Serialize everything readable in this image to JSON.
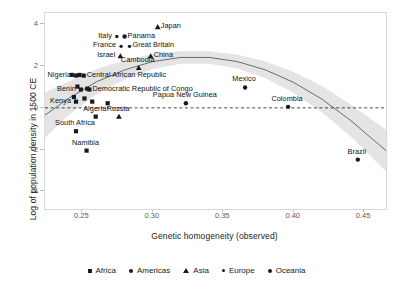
{
  "chart_data": {
    "type": "scatter",
    "title": "",
    "xlabel": "Genetic homogeneity (observed)",
    "ylabel": "Log of population density in 1500 CE",
    "xlim": [
      0.2235,
      0.4655
    ],
    "ylim": [
      -4.85,
      4.55
    ],
    "xticks": [
      "0.25",
      "0.30",
      "0.35",
      "0.40",
      "0.45"
    ],
    "xtick_values": [
      0.25,
      0.3,
      0.35,
      0.4,
      0.45
    ],
    "yticks": [
      "4",
      "2",
      "0",
      "-2",
      "-4"
    ],
    "ytick_values": [
      4,
      2,
      0,
      -2,
      -4
    ],
    "grid": false,
    "legend_position": "bottom",
    "reference_line": {
      "type": "horizontal",
      "y": 0,
      "style": "dashed"
    },
    "fit": {
      "type": "quadratic-loess",
      "band": "confidence interval",
      "band_color": "#d3d3d3",
      "line_color": "#6b6b6b",
      "x": [
        0.2235,
        0.24,
        0.26,
        0.28,
        0.3,
        0.32,
        0.34,
        0.36,
        0.38,
        0.4,
        0.42,
        0.44,
        0.4655
      ],
      "y": [
        -0.35,
        0.45,
        1.25,
        1.82,
        2.22,
        2.42,
        2.42,
        2.22,
        1.82,
        1.22,
        0.42,
        -0.58,
        -2.05
      ],
      "upper": [
        0.75,
        1.25,
        1.85,
        2.28,
        2.58,
        2.72,
        2.72,
        2.55,
        2.22,
        1.72,
        1.05,
        0.18,
        -1.05
      ],
      "lower": [
        -1.45,
        -0.35,
        0.65,
        1.36,
        1.86,
        2.12,
        2.12,
        1.89,
        1.42,
        0.72,
        -0.21,
        -1.34,
        -3.05
      ]
    },
    "legend": [
      {
        "label": "Africa",
        "marker": "square"
      },
      {
        "label": "Americas",
        "marker": "circle"
      },
      {
        "label": "Asia",
        "marker": "triangle"
      },
      {
        "label": "Europe",
        "marker": "dot"
      },
      {
        "label": "Oceania",
        "marker": "circle"
      }
    ],
    "points": [
      {
        "name": "Japan",
        "x": 0.3035,
        "y": 3.88,
        "marker": "triangle",
        "label_pos": "l"
      },
      {
        "name": "Italy",
        "x": 0.2745,
        "y": 3.42,
        "marker": "dot",
        "label_pos": "r"
      },
      {
        "name": "Panama",
        "x": 0.28,
        "y": 3.42,
        "marker": "circle",
        "label_pos": "l"
      },
      {
        "name": "France",
        "x": 0.2775,
        "y": 2.95,
        "marker": "dot",
        "label_pos": "r"
      },
      {
        "name": "Great Britain",
        "x": 0.2835,
        "y": 2.95,
        "marker": "dot",
        "label_pos": "l"
      },
      {
        "name": "Israel",
        "x": 0.277,
        "y": 2.48,
        "marker": "triangle",
        "label_pos": "r"
      },
      {
        "name": "China",
        "x": 0.2985,
        "y": 2.48,
        "marker": "triangle",
        "label_pos": "l"
      },
      {
        "name": "Cambodia",
        "x": 0.29,
        "y": 1.92,
        "marker": "triangle",
        "label_pos": "t"
      },
      {
        "name": "Nigeria",
        "x": 0.2455,
        "y": 1.55,
        "marker": "square",
        "label_pos": "r"
      },
      {
        "name": "Central African Republic",
        "x": 0.251,
        "y": 1.55,
        "marker": "square",
        "label_pos": "l"
      },
      {
        "name": "Benin",
        "x": 0.249,
        "y": 0.88,
        "marker": "square",
        "label_pos": "r"
      },
      {
        "name": "Democratic Republic of Congo",
        "x": 0.255,
        "y": 0.88,
        "marker": "square",
        "label_pos": "l"
      },
      {
        "name": "Kenya",
        "x": 0.2455,
        "y": 0.3,
        "marker": "square",
        "label_pos": "r"
      },
      {
        "name": "Algeria",
        "x": 0.2595,
        "y": -0.42,
        "marker": "square",
        "label_pos": "t"
      },
      {
        "name": "Russia",
        "x": 0.276,
        "y": -0.42,
        "marker": "triangle",
        "label_pos": "t"
      },
      {
        "name": "South Africa",
        "x": 0.2455,
        "y": -1.12,
        "marker": "square",
        "label_pos": "t"
      },
      {
        "name": "Namibia",
        "x": 0.253,
        "y": -2.05,
        "marker": "square",
        "label_pos": "t"
      },
      {
        "name": "Papua New Guinea",
        "x": 0.3235,
        "y": 0.22,
        "marker": "circle",
        "label_pos": "t"
      },
      {
        "name": "Mexico",
        "x": 0.3655,
        "y": 0.98,
        "marker": "circle",
        "label_pos": "t"
      },
      {
        "name": "Colombia",
        "x": 0.396,
        "y": 0.05,
        "marker": "circle",
        "label_pos": "t"
      },
      {
        "name": "Brazil",
        "x": 0.4455,
        "y": -2.48,
        "marker": "circle",
        "label_pos": "t"
      }
    ],
    "unlabeled_points": [
      {
        "x": 0.2425,
        "y": 1.58,
        "marker": "square"
      },
      {
        "x": 0.248,
        "y": 1.58,
        "marker": "square"
      },
      {
        "x": 0.2465,
        "y": 1.02,
        "marker": "square"
      },
      {
        "x": 0.2535,
        "y": 0.92,
        "marker": "square"
      },
      {
        "x": 0.244,
        "y": 0.52,
        "marker": "square"
      },
      {
        "x": 0.2515,
        "y": 0.45,
        "marker": "square"
      },
      {
        "x": 0.257,
        "y": 0.3,
        "marker": "square"
      },
      {
        "x": 0.268,
        "y": 0.22,
        "marker": "square"
      }
    ]
  }
}
